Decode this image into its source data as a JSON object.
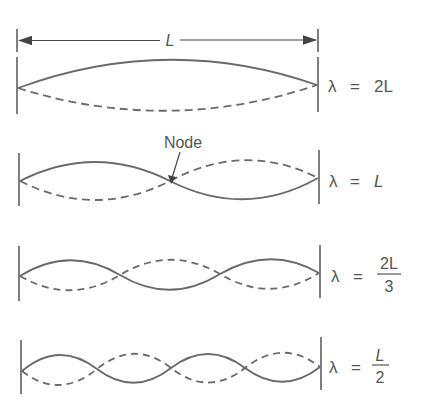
{
  "diagram": {
    "stroke_color": "#6a6a6a",
    "dimension": {
      "label": "L"
    },
    "node_label": "Node",
    "modes": [
      {
        "lambda_symbol": "λ",
        "equals": "=",
        "value": "2L",
        "numerator": "",
        "denominator": "",
        "half_wavelengths": 1
      },
      {
        "lambda_symbol": "λ",
        "equals": "=",
        "value": "L",
        "numerator": "",
        "denominator": "",
        "half_wavelengths": 2
      },
      {
        "lambda_symbol": "λ",
        "equals": "=",
        "value": "",
        "numerator": "2L",
        "denominator": "3",
        "half_wavelengths": 3
      },
      {
        "lambda_symbol": "λ",
        "equals": "=",
        "value": "",
        "numerator": "L",
        "denominator": "2",
        "half_wavelengths": 4
      }
    ]
  }
}
